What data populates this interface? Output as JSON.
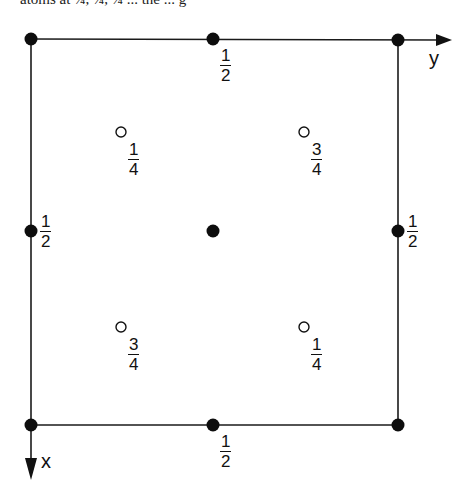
{
  "header_fragment": "atoms at ¼, ¼, ¼ ... the ... g",
  "diagram": {
    "type": "crystal-structure-projection",
    "axes": {
      "horizontal": "y",
      "vertical": "x"
    },
    "frame": {
      "left": 31,
      "top": 39,
      "right": 398,
      "bottom": 425
    },
    "filled_atoms": [
      {
        "id": "corner-tl",
        "x": 31,
        "y": 39,
        "label": ""
      },
      {
        "id": "edge-top",
        "x": 213,
        "y": 39,
        "label": "1/2"
      },
      {
        "id": "corner-tr",
        "x": 398,
        "y": 40,
        "label": ""
      },
      {
        "id": "edge-left",
        "x": 31,
        "y": 231,
        "label": "1/2"
      },
      {
        "id": "center",
        "x": 213,
        "y": 231,
        "label": ""
      },
      {
        "id": "edge-right",
        "x": 398,
        "y": 231,
        "label": "1/2"
      },
      {
        "id": "corner-bl",
        "x": 31,
        "y": 425,
        "label": ""
      },
      {
        "id": "edge-bottom",
        "x": 213,
        "y": 425,
        "label": "1/2"
      },
      {
        "id": "corner-br",
        "x": 398,
        "y": 425,
        "label": ""
      }
    ],
    "open_atoms": [
      {
        "id": "open-tl",
        "x": 121,
        "y": 132,
        "label": "1/4"
      },
      {
        "id": "open-tr",
        "x": 304,
        "y": 132,
        "label": "3/4"
      },
      {
        "id": "open-bl",
        "x": 121,
        "y": 327,
        "label": "3/4"
      },
      {
        "id": "open-br",
        "x": 304,
        "y": 327,
        "label": "1/4"
      }
    ],
    "labels": {
      "edge_top": {
        "num": "1",
        "den": "2"
      },
      "edge_bottom": {
        "num": "1",
        "den": "2"
      },
      "edge_left": {
        "num": "1",
        "den": "2"
      },
      "edge_right": {
        "num": "1",
        "den": "2"
      },
      "open_tl": {
        "num": "1",
        "den": "4"
      },
      "open_tr": {
        "num": "3",
        "den": "4"
      },
      "open_bl": {
        "num": "3",
        "den": "4"
      },
      "open_br": {
        "num": "1",
        "den": "4"
      },
      "axis_y": "y",
      "axis_x": "x"
    }
  }
}
